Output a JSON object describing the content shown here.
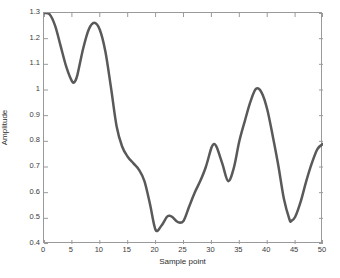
{
  "chart_data": {
    "type": "line",
    "title": "",
    "subtitle": "",
    "xlabel": "Sample point",
    "ylabel": "Amplitude",
    "xlim": [
      0,
      50
    ],
    "ylim": [
      0.4,
      1.3
    ],
    "xticks": [
      0,
      5,
      10,
      15,
      20,
      25,
      30,
      35,
      40,
      45,
      50
    ],
    "yticks": [
      0.4,
      0.5,
      0.6,
      0.7,
      0.8,
      0.9,
      1,
      1.1,
      1.2,
      1.3
    ],
    "xtick_labels": [
      "0",
      "5",
      "10",
      "15",
      "20",
      "25",
      "30",
      "35",
      "40",
      "45",
      "50"
    ],
    "ytick_labels": [
      "0.4",
      "0.5",
      "0.6",
      "0.7",
      "0.8",
      "0.9",
      "1",
      "1.1",
      "1.2",
      "1.3"
    ],
    "grid": false,
    "legend": null,
    "legend_position": "none",
    "line_color": "#595959",
    "line_width": 2.5,
    "axis_color": "#9a9a9a",
    "background": "#ffffff",
    "series": [
      {
        "name": "amplitude",
        "x": [
          0,
          1,
          2,
          3,
          4,
          5,
          5.5,
          6,
          7,
          8,
          9,
          10,
          11,
          12,
          13,
          14,
          15,
          16,
          17,
          18,
          19,
          20,
          21,
          22,
          22.5,
          23,
          24,
          25,
          26,
          27,
          28,
          29,
          30,
          30.5,
          31,
          32,
          33,
          34,
          35,
          36,
          37,
          38,
          39,
          40,
          41,
          42,
          43,
          44,
          44.3,
          45,
          46,
          47,
          48,
          49,
          50
        ],
        "values": [
          1.3,
          1.295,
          1.25,
          1.17,
          1.09,
          1.035,
          1.032,
          1.06,
          1.16,
          1.235,
          1.262,
          1.235,
          1.15,
          1.01,
          0.86,
          0.78,
          0.74,
          0.715,
          0.69,
          0.645,
          0.555,
          0.455,
          0.47,
          0.505,
          0.51,
          0.505,
          0.485,
          0.49,
          0.545,
          0.6,
          0.645,
          0.7,
          0.775,
          0.79,
          0.775,
          0.71,
          0.645,
          0.695,
          0.8,
          0.88,
          0.955,
          1.005,
          0.99,
          0.925,
          0.82,
          0.705,
          0.575,
          0.495,
          0.49,
          0.505,
          0.565,
          0.645,
          0.715,
          0.77,
          0.79
        ]
      }
    ]
  }
}
